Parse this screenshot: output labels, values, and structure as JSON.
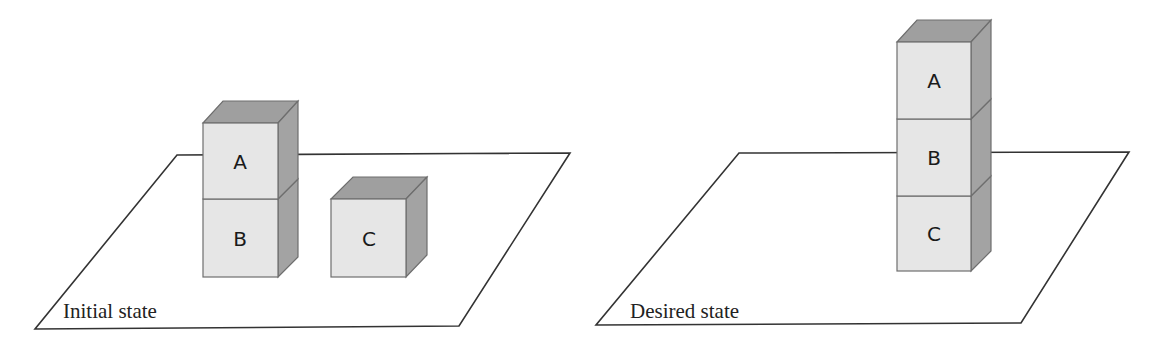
{
  "scenes": [
    {
      "id": "initial",
      "caption": "Initial state",
      "blocks": [
        {
          "label": "A"
        },
        {
          "label": "B"
        },
        {
          "label": "C"
        }
      ]
    },
    {
      "id": "desired",
      "caption": "Desired state",
      "blocks": [
        {
          "label": "A"
        },
        {
          "label": "B"
        },
        {
          "label": "C"
        }
      ]
    }
  ],
  "colors": {
    "front_face": "#e6e6e6",
    "side_face": "#a3a3a3",
    "top_face": "#9f9f9f",
    "plane_stroke": "#333333"
  }
}
